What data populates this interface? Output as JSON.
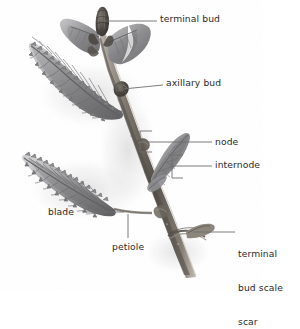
{
  "figure": {
    "background_color": "#ffffff",
    "label_color": "#2a2a2a",
    "leader_color": "#6e6e6e",
    "specimen_colors": {
      "stem_dark": "#4b4742",
      "stem_mid": "#7a756d",
      "stem_light": "#b3ada3",
      "leaf_dark": "#6f6f71",
      "leaf_mid": "#9b9b9d",
      "leaf_light": "#c6c6c8",
      "bud_dark": "#3f3b36",
      "shadow": "#dcdcdc"
    }
  },
  "labels": [
    {
      "id": "terminal-bud",
      "text": "terminal bud",
      "x": 160,
      "y": 17,
      "align": "left",
      "lines": [
        "terminal bud"
      ]
    },
    {
      "id": "axillary-bud",
      "text": "axillary bud",
      "x": 166,
      "y": 81,
      "align": "left",
      "lines": [
        "axillary bud"
      ]
    },
    {
      "id": "node",
      "text": "node",
      "x": 215,
      "y": 138,
      "align": "left",
      "lines": [
        "node"
      ]
    },
    {
      "id": "internode",
      "text": "internode",
      "x": 215,
      "y": 160,
      "align": "left",
      "lines": [
        "internode"
      ]
    },
    {
      "id": "blade",
      "text": "blade",
      "x": 48,
      "y": 207,
      "align": "left",
      "lines": [
        "blade"
      ]
    },
    {
      "id": "petiole",
      "text": "petiole",
      "x": 112,
      "y": 243,
      "align": "left",
      "lines": [
        "petiole"
      ]
    },
    {
      "id": "terminal-bud-scale-scar",
      "text": "terminal bud scale scar",
      "x": 238,
      "y": 226,
      "align": "left",
      "lines": [
        "terminal",
        "bud scale",
        "scar"
      ]
    }
  ],
  "anatomy_parts": [
    "terminal bud",
    "axillary bud",
    "node",
    "internode",
    "blade",
    "petiole",
    "terminal bud scale scar"
  ]
}
